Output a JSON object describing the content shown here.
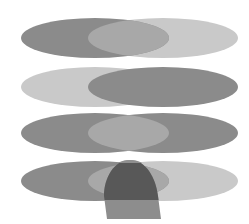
{
  "diagram": {
    "type": "set-operations-ellipses",
    "rows": [
      {
        "id": "row-1",
        "description": "Left ellipse dark, right ellipse light, overlap medium",
        "left_fill": "#8b8b8b",
        "right_fill": "#c9c9c9",
        "overlap_fill": "#a8a8a8"
      },
      {
        "id": "row-2",
        "description": "Left ellipse light, right ellipse dark, overlap dark",
        "left_fill": "#c9c9c9",
        "right_fill": "#8b8b8b",
        "overlap_fill": "#8b8b8b"
      },
      {
        "id": "row-3",
        "description": "Both ellipses dark, overlap medium",
        "left_fill": "#8b8b8b",
        "right_fill": "#8b8b8b",
        "overlap_fill": "#a8a8a8"
      },
      {
        "id": "row-4",
        "description": "Left dark, right light, overlap medium, with dome-shaped third region",
        "left_fill": "#8b8b8b",
        "right_fill": "#c9c9c9",
        "overlap_fill": "#a8a8a8",
        "dome_fill": "#585858",
        "dome_tip_fill": "#8f8f8f",
        "base_fill": "#8d8d8d"
      }
    ]
  }
}
